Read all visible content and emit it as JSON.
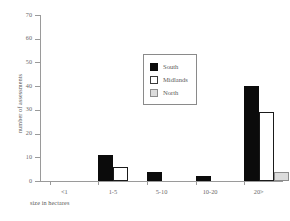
{
  "chart_data": {
    "type": "bar",
    "title": "",
    "xlabel": "size in hectares",
    "ylabel": "number of assessments",
    "categories": [
      "<1",
      "1-5",
      "5-10",
      "10-20",
      "20>"
    ],
    "series": [
      {
        "name": "South",
        "color": "#0b0b0b",
        "values": [
          0,
          11,
          4,
          2,
          40
        ]
      },
      {
        "name": "Midlands",
        "color": "#ffffff",
        "values": [
          0,
          6,
          0,
          0,
          29
        ]
      },
      {
        "name": "North",
        "color": "#dcdcdc",
        "values": [
          0,
          0,
          0,
          0,
          4
        ]
      }
    ],
    "ylim": [
      0,
      70
    ],
    "ytick_labels": [
      "0",
      "10",
      "20",
      "30",
      "40",
      "50",
      "60",
      "70"
    ],
    "ytick_values": [
      0,
      10,
      20,
      30,
      40,
      50,
      60,
      70
    ],
    "grid": false,
    "legend_position": "upper center"
  }
}
